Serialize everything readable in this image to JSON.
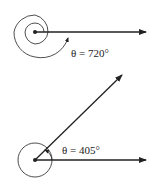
{
  "diagram": {
    "type": "angle-rotation",
    "colors": {
      "stroke": "#222222",
      "background": "#ffffff"
    },
    "figures": [
      {
        "id": "angle-720",
        "label": "θ = 720°",
        "angle_degrees": 720,
        "rotations": 2,
        "description": "Initial and terminal sides coincide along positive x-axis; two full counterclockwise turns shown as spiral"
      },
      {
        "id": "angle-405",
        "label": "θ = 405°",
        "angle_degrees": 405,
        "rotations": 1.125,
        "description": "One full turn plus 45°; terminal side at 45° above initial side"
      }
    ]
  }
}
